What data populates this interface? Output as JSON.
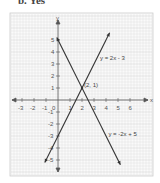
{
  "caption": "b. Yes",
  "chart_data": {
    "type": "line",
    "title": "",
    "xlabel": "x",
    "ylabel": "y",
    "xlim": [
      -3.5,
      6.5
    ],
    "ylim": [
      -5.5,
      5.5
    ],
    "grid": true,
    "x_ticks": [
      -3,
      -2,
      -1,
      1,
      2,
      3,
      4,
      5,
      6
    ],
    "y_ticks": [
      5,
      4,
      3,
      2,
      1,
      -1,
      -2,
      -3,
      -4,
      -5
    ],
    "origin_label": "0",
    "series": [
      {
        "name": "y = 2x - 3",
        "x": [
          -1.1,
          4.3
        ],
        "y": [
          -5.2,
          5.6
        ]
      },
      {
        "name": "y = -2x + 5",
        "x": [
          -0.1,
          5.2
        ],
        "y": [
          5.2,
          -5.4
        ]
      }
    ],
    "annotations": [
      {
        "text": "(2, 1)",
        "x": 2,
        "y": 1
      },
      {
        "text": "y = 2x - 3",
        "x": 3.5,
        "y": 3.5
      },
      {
        "text": "y = -2x + 5",
        "x": 4.2,
        "y": -2.8
      }
    ]
  }
}
